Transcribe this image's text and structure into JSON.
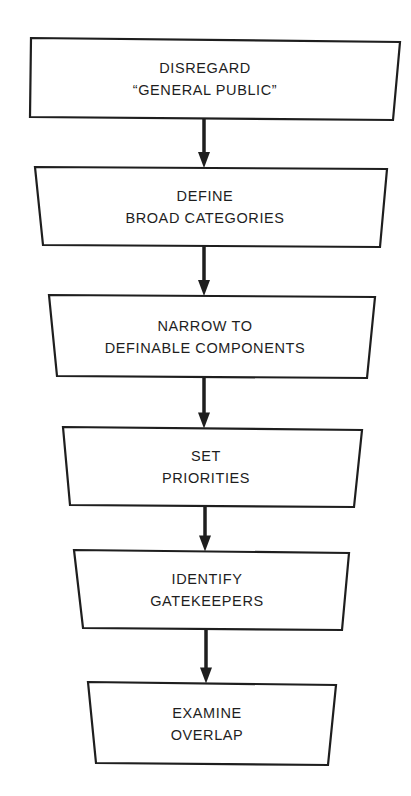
{
  "diagram": {
    "type": "flowchart",
    "direction": "top-to-bottom",
    "colors": {
      "line": "#1e1e1e",
      "text": "#1e1e1e",
      "background": "#ffffff"
    },
    "steps": [
      {
        "id": "disregard-general-public",
        "lines": [
          "DISREGARD",
          "“GENERAL PUBLIC”"
        ]
      },
      {
        "id": "define-broad-categories",
        "lines": [
          "DEFINE",
          "BROAD CATEGORIES"
        ]
      },
      {
        "id": "narrow-to-definable-components",
        "lines": [
          "NARROW TO",
          "DEFINABLE COMPONENTS"
        ]
      },
      {
        "id": "set-priorities",
        "lines": [
          "SET",
          "PRIORITIES"
        ]
      },
      {
        "id": "identify-gatekeepers",
        "lines": [
          "IDENTIFY",
          "GATEKEEPERS"
        ]
      },
      {
        "id": "examine-overlap",
        "lines": [
          "EXAMINE",
          "OVERLAP"
        ]
      }
    ],
    "connections": [
      {
        "from": "disregard-general-public",
        "to": "define-broad-categories"
      },
      {
        "from": "define-broad-categories",
        "to": "narrow-to-definable-components"
      },
      {
        "from": "narrow-to-definable-components",
        "to": "set-priorities"
      },
      {
        "from": "set-priorities",
        "to": "identify-gatekeepers"
      },
      {
        "from": "identify-gatekeepers",
        "to": "examine-overlap"
      }
    ]
  }
}
